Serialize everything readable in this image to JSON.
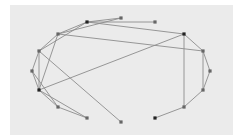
{
  "diagram": {
    "type": "network-graph",
    "layout": "circular",
    "colors": {
      "background": "#ebebeb",
      "edge": "#8c8c8c",
      "node_dark": "#222222",
      "node_gray": "#666666"
    },
    "nodes": [
      {
        "id": "n1",
        "x": 87,
        "y": 22,
        "shade": "dark"
      },
      {
        "id": "n2",
        "x": 121,
        "y": 18,
        "shade": "gray"
      },
      {
        "id": "n3",
        "x": 155,
        "y": 22,
        "shade": "gray"
      },
      {
        "id": "n4",
        "x": 184,
        "y": 34,
        "shade": "dark"
      },
      {
        "id": "n5",
        "x": 203,
        "y": 51,
        "shade": "gray"
      },
      {
        "id": "n6",
        "x": 210,
        "y": 71,
        "shade": "gray"
      },
      {
        "id": "n7",
        "x": 203,
        "y": 90,
        "shade": "gray"
      },
      {
        "id": "n8",
        "x": 184,
        "y": 107,
        "shade": "gray"
      },
      {
        "id": "n9",
        "x": 155,
        "y": 118,
        "shade": "dark"
      },
      {
        "id": "n10",
        "x": 121,
        "y": 122,
        "shade": "gray"
      },
      {
        "id": "n11",
        "x": 87,
        "y": 118,
        "shade": "gray"
      },
      {
        "id": "n12",
        "x": 58,
        "y": 107,
        "shade": "gray"
      },
      {
        "id": "n13",
        "x": 39,
        "y": 90,
        "shade": "dark"
      },
      {
        "id": "n14",
        "x": 32,
        "y": 71,
        "shade": "gray"
      },
      {
        "id": "n15",
        "x": 39,
        "y": 51,
        "shade": "gray"
      },
      {
        "id": "n16",
        "x": 58,
        "y": 34,
        "shade": "gray"
      }
    ],
    "edges": [
      [
        "n1",
        "n2"
      ],
      [
        "n1",
        "n3"
      ],
      [
        "n1",
        "n4"
      ],
      [
        "n1",
        "n16"
      ],
      [
        "n16",
        "n2"
      ],
      [
        "n16",
        "n5"
      ],
      [
        "n16",
        "n15"
      ],
      [
        "n16",
        "n13"
      ],
      [
        "n15",
        "n1"
      ],
      [
        "n15",
        "n14"
      ],
      [
        "n15",
        "n13"
      ],
      [
        "n15",
        "n10"
      ],
      [
        "n14",
        "n13"
      ],
      [
        "n14",
        "n12"
      ],
      [
        "n13",
        "n4"
      ],
      [
        "n13",
        "n12"
      ],
      [
        "n13",
        "n11"
      ],
      [
        "n12",
        "n11"
      ],
      [
        "n4",
        "n5"
      ],
      [
        "n4",
        "n8"
      ],
      [
        "n5",
        "n6"
      ],
      [
        "n5",
        "n7"
      ],
      [
        "n6",
        "n7"
      ],
      [
        "n7",
        "n8"
      ],
      [
        "n8",
        "n9"
      ]
    ]
  }
}
